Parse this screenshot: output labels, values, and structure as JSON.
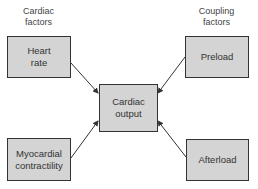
{
  "diagram": {
    "group_labels": {
      "left": "Cardiac factors",
      "right": "Coupling factors"
    },
    "group_labels_lines": {
      "left": [
        "Cardiac",
        "factors"
      ],
      "right": [
        "Coupling",
        "factors"
      ]
    },
    "nodes": {
      "heart_rate": [
        "Heart",
        "rate"
      ],
      "preload": [
        "Preload"
      ],
      "cardiac_output": [
        "Cardiac",
        "output"
      ],
      "myocardial_contractility": [
        "Myocardial",
        "contractility"
      ],
      "afterload": [
        "Afterload"
      ]
    },
    "edges": [
      {
        "from": "Heart rate",
        "to": "Cardiac output"
      },
      {
        "from": "Preload",
        "to": "Cardiac output"
      },
      {
        "from": "Myocardial contractility",
        "to": "Cardiac output"
      },
      {
        "from": "Afterload",
        "to": "Cardiac output"
      }
    ],
    "colors": {
      "box_fill": "#d4d4d4",
      "box_border": "#333333",
      "arrow": "#333333"
    }
  }
}
